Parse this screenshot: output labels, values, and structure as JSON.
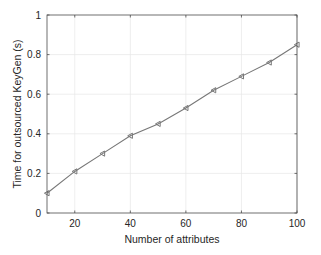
{
  "chart_data": {
    "type": "line",
    "title": "",
    "xlabel": "Number of attributes",
    "ylabel": "Time for outsourced KeyGen (s)",
    "xlim": [
      10,
      100
    ],
    "ylim": [
      0,
      1
    ],
    "xticks": [
      20,
      40,
      60,
      80,
      100
    ],
    "yticks": [
      0,
      0.2,
      0.4,
      0.6,
      0.8,
      1
    ],
    "ytick_labels": [
      "0",
      "0.2",
      "0.4",
      "0.6",
      "0.8",
      "1"
    ],
    "xtick_labels": [
      "20",
      "40",
      "60",
      "80",
      "100"
    ],
    "grid": true,
    "legend": null,
    "series": [
      {
        "name": "Outsourced KeyGen",
        "marker": "left-triangle",
        "color": "#777777",
        "x": [
          10,
          20,
          30,
          40,
          50,
          60,
          70,
          80,
          90,
          100
        ],
        "values": [
          0.1,
          0.21,
          0.3,
          0.39,
          0.45,
          0.53,
          0.62,
          0.69,
          0.76,
          0.85
        ]
      }
    ]
  },
  "colors": {
    "line": "#777777",
    "grid": "#e6e6e6",
    "axes": "#4d4d4d",
    "text": "#262626"
  }
}
